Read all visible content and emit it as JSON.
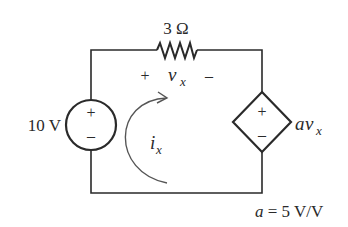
{
  "circuit": {
    "resistor": {
      "label": "3 Ω"
    },
    "voltage_source": {
      "label": "10 V",
      "plus": "+",
      "minus": "–"
    },
    "dependent_source": {
      "label_a": "a",
      "label_v": "v",
      "label_sub": "x",
      "plus": "+",
      "minus": "–"
    },
    "vx_polarity": {
      "plus": "+",
      "var": "v",
      "sub": "x",
      "minus": "–"
    },
    "current": {
      "var": "i",
      "sub": "x"
    },
    "gain_note": {
      "var": "a",
      "text": " = 5 V/V"
    }
  },
  "colors": {
    "wire": "#2a2a2a",
    "background": "#ffffff"
  }
}
